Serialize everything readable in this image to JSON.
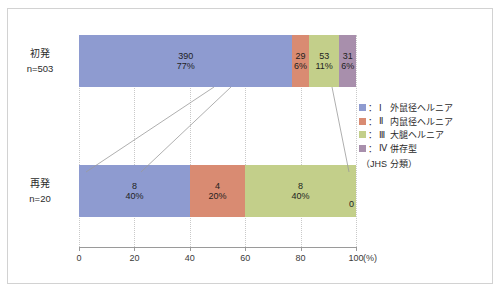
{
  "chart_data": {
    "type": "bar",
    "orientation": "horizontal",
    "stacked": true,
    "normalized_percent": true,
    "title": "",
    "xlabel": "(%)",
    "ylabel": "",
    "xlim": [
      0,
      100
    ],
    "xticks": [
      "0",
      "20",
      "40",
      "60",
      "80",
      "100"
    ],
    "xtick_values": [
      0,
      20,
      40,
      60,
      80,
      100
    ],
    "grid": "vertical-dotted",
    "legend_position": "right",
    "categories": [
      "初発",
      "再発"
    ],
    "category_sublabels": [
      "n=503",
      "n=20"
    ],
    "series": [
      {
        "name": "Ⅰ 外鼠径ヘルニア",
        "color": "#8e9bd0",
        "counts": [
          390,
          8
        ],
        "percents": [
          77,
          40
        ]
      },
      {
        "name": "Ⅱ 内鼠径ヘルニア",
        "color": "#d98b72",
        "counts": [
          29,
          4
        ],
        "percents": [
          6,
          20
        ]
      },
      {
        "name": "Ⅲ 大腿ヘルニア",
        "color": "#c3cf8a",
        "counts": [
          53,
          8
        ],
        "percents": [
          11,
          40
        ]
      },
      {
        "name": "Ⅳ 併存型",
        "color": "#a88fac",
        "counts": [
          31,
          0
        ],
        "percents": [
          6,
          0
        ]
      }
    ]
  },
  "rows": [
    {
      "name": "初発",
      "n_label": "n=503",
      "segments": [
        {
          "count_label": "390",
          "pct_label": "77%",
          "width_pct": 77,
          "color": "#8e9bd0",
          "show_labels": true
        },
        {
          "count_label": "29",
          "pct_label": "6%",
          "width_pct": 6,
          "color": "#d98b72",
          "show_labels": true
        },
        {
          "count_label": "53",
          "pct_label": "11%",
          "width_pct": 11,
          "color": "#c3cf8a",
          "show_labels": true
        },
        {
          "count_label": "31",
          "pct_label": "6%",
          "width_pct": 6,
          "color": "#a88fac",
          "show_labels": true
        }
      ]
    },
    {
      "name": "再発",
      "n_label": "n=20",
      "segments": [
        {
          "count_label": "8",
          "pct_label": "40%",
          "width_pct": 40,
          "color": "#8e9bd0",
          "show_labels": true
        },
        {
          "count_label": "4",
          "pct_label": "20%",
          "width_pct": 20,
          "color": "#d98b72",
          "show_labels": true
        },
        {
          "count_label": "8",
          "pct_label": "40%",
          "width_pct": 40,
          "color": "#c3cf8a",
          "show_labels": true
        },
        {
          "count_label": "0",
          "pct_label": "",
          "width_pct": 0,
          "color": "#a88fac",
          "show_labels": false
        }
      ]
    }
  ],
  "zero_marker": "0",
  "axis": {
    "unit_label": "(%)",
    "ticks": [
      "0",
      "20",
      "40",
      "60",
      "80",
      "100"
    ]
  },
  "legend": {
    "items": [
      {
        "numeral": "Ⅰ",
        "label": "外鼠径ヘルニア",
        "color": "#8e9bd0"
      },
      {
        "numeral": "Ⅱ",
        "label": "内鼠径ヘルニア",
        "color": "#d98b72"
      },
      {
        "numeral": "Ⅲ",
        "label": "大腿ヘルニア",
        "color": "#c3cf8a"
      },
      {
        "numeral": "Ⅳ",
        "label": "併存型",
        "color": "#a88fac"
      }
    ],
    "note": "（JHS 分類）",
    "separator": "："
  }
}
